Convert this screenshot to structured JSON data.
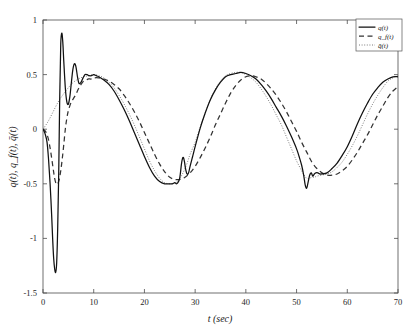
{
  "chart_data": {
    "type": "line",
    "title": "",
    "xlabel": "t (sec)",
    "ylabel": "q(t), q_f(t), q̄(t)",
    "xlim": [
      0,
      70
    ],
    "ylim": [
      -1.5,
      1
    ],
    "xticks": [
      0,
      10,
      20,
      30,
      40,
      50,
      60,
      70
    ],
    "yticks": [
      1,
      0.5,
      0,
      -0.5,
      -1,
      -1.5
    ],
    "xtick_labels": [
      "0",
      "10",
      "20",
      "30",
      "40",
      "50",
      "60",
      "70"
    ],
    "ytick_labels": [
      "1",
      "0.5",
      "0",
      "-0.5",
      "-1",
      "-1.5"
    ],
    "grid": false,
    "legend_position": "top-right",
    "legend": [
      {
        "label": "q(t)",
        "style": "solid"
      },
      {
        "label": "q_f(t)",
        "style": "dashed"
      },
      {
        "label": "q̄(t)",
        "style": "dotted"
      }
    ],
    "series": [
      {
        "name": "q(t)",
        "style": "solid",
        "x": [
          0,
          0.4,
          0.8,
          1.1,
          1.4,
          1.7,
          1.9,
          2.1,
          2.3,
          2.5,
          2.7,
          2.9,
          3.1,
          3.3,
          3.5,
          3.7,
          3.9,
          4.1,
          4.4,
          4.7,
          5.0,
          5.3,
          5.6,
          5.9,
          6.2,
          6.5,
          6.8,
          7.1,
          7.5,
          7.9,
          8.3,
          8.7,
          9.1,
          9.5,
          10.0,
          10.5,
          11.0,
          12.0,
          13.0,
          14.0,
          15.0,
          16.0,
          17.0,
          18.0,
          19.0,
          20.0,
          21.0,
          22.0,
          23.0,
          24.0,
          25.0,
          25.5,
          26.0,
          26.3,
          26.6,
          26.9,
          27.1,
          27.3,
          27.5,
          27.7,
          27.9,
          28.1,
          28.4,
          28.7,
          29.0,
          29.5,
          30.0,
          31.0,
          32.0,
          33.0,
          34.0,
          35.0,
          36.0,
          37.0,
          38.0,
          39.0,
          40.0,
          41.0,
          42.0,
          43.0,
          44.0,
          45.0,
          46.0,
          47.0,
          48.0,
          49.0,
          50.0,
          50.5,
          51.0,
          51.4,
          51.7,
          52.0,
          52.3,
          52.6,
          52.9,
          53.2,
          53.5,
          53.8,
          54.2,
          54.6,
          55.0,
          56.0,
          57.0,
          58.0,
          59.0,
          60.0,
          61.0,
          62.0,
          63.0,
          64.0,
          65.0,
          66.0,
          67.0,
          68.0,
          69.0,
          70.0
        ],
        "y": [
          0.0,
          -0.04,
          -0.12,
          -0.28,
          -0.5,
          -0.78,
          -1.0,
          -1.18,
          -1.28,
          -1.31,
          -1.22,
          -0.9,
          -0.4,
          0.3,
          0.78,
          0.88,
          0.8,
          0.62,
          0.38,
          0.25,
          0.23,
          0.3,
          0.43,
          0.55,
          0.6,
          0.57,
          0.48,
          0.42,
          0.43,
          0.47,
          0.5,
          0.5,
          0.49,
          0.49,
          0.5,
          0.49,
          0.48,
          0.45,
          0.41,
          0.35,
          0.27,
          0.18,
          0.08,
          -0.03,
          -0.14,
          -0.25,
          -0.35,
          -0.43,
          -0.48,
          -0.5,
          -0.5,
          -0.5,
          -0.49,
          -0.5,
          -0.49,
          -0.46,
          -0.4,
          -0.32,
          -0.27,
          -0.26,
          -0.3,
          -0.36,
          -0.41,
          -0.4,
          -0.34,
          -0.25,
          -0.16,
          0.01,
          0.15,
          0.27,
          0.36,
          0.43,
          0.48,
          0.5,
          0.51,
          0.52,
          0.51,
          0.49,
          0.46,
          0.41,
          0.35,
          0.28,
          0.2,
          0.12,
          0.03,
          -0.07,
          -0.18,
          -0.25,
          -0.33,
          -0.42,
          -0.51,
          -0.54,
          -0.48,
          -0.42,
          -0.4,
          -0.43,
          -0.41,
          -0.4,
          -0.4,
          -0.41,
          -0.41,
          -0.4,
          -0.36,
          -0.31,
          -0.24,
          -0.16,
          -0.06,
          0.05,
          0.15,
          0.24,
          0.32,
          0.38,
          0.43,
          0.46,
          0.48,
          0.48
        ]
      },
      {
        "name": "q_f(t)",
        "style": "dashed",
        "x": [
          0,
          0.5,
          1.0,
          1.5,
          2.0,
          2.3,
          2.6,
          2.9,
          3.2,
          3.5,
          3.8,
          4.1,
          4.4,
          4.7,
          5.0,
          5.5,
          6.0,
          6.5,
          7.0,
          7.5,
          8.0,
          8.5,
          9.0,
          9.5,
          10.0,
          11.0,
          12.0,
          13.0,
          14.0,
          15.0,
          16.0,
          17.0,
          18.0,
          19.0,
          20.0,
          21.0,
          22.0,
          23.0,
          24.0,
          25.0,
          26.0,
          27.0,
          28.0,
          29.0,
          30.0,
          31.0,
          32.0,
          33.0,
          34.0,
          35.0,
          36.0,
          37.0,
          38.0,
          39.0,
          40.0,
          41.0,
          42.0,
          43.0,
          44.0,
          45.0,
          46.0,
          47.0,
          48.0,
          49.0,
          50.0,
          51.0,
          52.0,
          53.0,
          54.0,
          55.0,
          56.0,
          57.0,
          58.0,
          59.0,
          60.0,
          61.0,
          62.0,
          63.0,
          64.0,
          65.0,
          66.0,
          67.0,
          68.0,
          69.0,
          70.0
        ],
        "y": [
          0.0,
          -0.02,
          -0.08,
          -0.2,
          -0.36,
          -0.45,
          -0.5,
          -0.5,
          -0.46,
          -0.38,
          -0.27,
          -0.14,
          0.0,
          0.1,
          0.17,
          0.24,
          0.28,
          0.32,
          0.37,
          0.41,
          0.44,
          0.45,
          0.46,
          0.46,
          0.47,
          0.47,
          0.46,
          0.44,
          0.41,
          0.37,
          0.31,
          0.24,
          0.16,
          0.07,
          -0.03,
          -0.13,
          -0.23,
          -0.32,
          -0.39,
          -0.44,
          -0.46,
          -0.46,
          -0.44,
          -0.4,
          -0.34,
          -0.26,
          -0.17,
          -0.07,
          0.04,
          0.14,
          0.24,
          0.33,
          0.4,
          0.45,
          0.48,
          0.49,
          0.48,
          0.46,
          0.42,
          0.37,
          0.31,
          0.24,
          0.16,
          0.07,
          -0.02,
          -0.12,
          -0.21,
          -0.3,
          -0.36,
          -0.4,
          -0.42,
          -0.42,
          -0.41,
          -0.38,
          -0.34,
          -0.28,
          -0.21,
          -0.13,
          -0.05,
          0.04,
          0.13,
          0.21,
          0.29,
          0.35,
          0.39
        ]
      },
      {
        "name": "q̄(t)",
        "style": "dotted",
        "x": [
          0,
          1.0,
          2.0,
          3.0,
          4.0,
          5.0,
          6.0,
          7.0,
          8.0,
          9.0,
          10.0,
          11.0,
          12.0,
          13.0,
          14.0,
          15.0,
          16.0,
          17.0,
          18.0,
          19.0,
          20.0,
          21.0,
          22.0,
          23.0,
          24.0,
          25.0,
          26.0,
          26.5,
          27.0,
          27.5,
          28.0,
          28.5,
          29.0,
          30.0,
          31.0,
          32.0,
          33.0,
          34.0,
          35.0,
          36.0,
          37.0,
          38.0,
          39.0,
          40.0,
          41.0,
          42.0,
          43.0,
          44.0,
          45.0,
          46.0,
          47.0,
          48.0,
          49.0,
          50.0,
          51.0,
          51.5,
          52.0,
          52.5,
          53.0,
          53.5,
          54.0,
          55.0,
          56.0,
          57.0,
          58.0,
          59.0,
          60.0,
          61.0,
          62.0,
          63.0,
          64.0,
          65.0,
          66.0,
          67.0,
          68.0,
          69.0,
          70.0
        ],
        "y": [
          0.0,
          0.07,
          0.16,
          0.25,
          0.32,
          0.38,
          0.43,
          0.46,
          0.48,
          0.49,
          0.5,
          0.49,
          0.47,
          0.43,
          0.38,
          0.31,
          0.23,
          0.14,
          0.04,
          -0.07,
          -0.18,
          -0.29,
          -0.38,
          -0.45,
          -0.49,
          -0.5,
          -0.49,
          -0.48,
          -0.45,
          -0.41,
          -0.36,
          -0.3,
          -0.23,
          -0.12,
          0.02,
          0.15,
          0.27,
          0.37,
          0.44,
          0.49,
          0.51,
          0.52,
          0.52,
          0.5,
          0.47,
          0.43,
          0.37,
          0.3,
          0.22,
          0.13,
          0.04,
          -0.07,
          -0.18,
          -0.29,
          -0.38,
          -0.42,
          -0.45,
          -0.45,
          -0.44,
          -0.44,
          -0.43,
          -0.42,
          -0.41,
          -0.39,
          -0.35,
          -0.3,
          -0.23,
          -0.15,
          -0.06,
          0.04,
          0.14,
          0.23,
          0.31,
          0.38,
          0.44,
          0.47,
          0.49
        ]
      }
    ]
  }
}
